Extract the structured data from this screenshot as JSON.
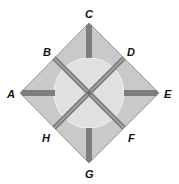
{
  "diagram": {
    "type": "square-rotated-with-diagonals",
    "colors": {
      "background": "#ffffff",
      "square_fill": "#c9c9c9",
      "square_stroke": "#8a8a8a",
      "circle_fill": "#e2e2e2",
      "circle_stroke": "#f4f4f4",
      "bar": "#7d7d7d",
      "label": "#111111"
    },
    "labels": {
      "A": "A",
      "B": "B",
      "C": "C",
      "D": "D",
      "E": "E",
      "F": "F",
      "G": "G",
      "H": "H"
    },
    "points": {
      "A": {
        "role": "left vertex"
      },
      "B": {
        "role": "upper-left edge midpoint"
      },
      "C": {
        "role": "top vertex"
      },
      "D": {
        "role": "upper-right edge midpoint"
      },
      "E": {
        "role": "right vertex"
      },
      "F": {
        "role": "lower-right edge midpoint"
      },
      "G": {
        "role": "bottom vertex"
      },
      "H": {
        "role": "lower-left edge midpoint"
      }
    },
    "segments": [
      "BF",
      "DH",
      "C-center stub",
      "A-center stub",
      "E-center stub",
      "G-center stub"
    ]
  }
}
